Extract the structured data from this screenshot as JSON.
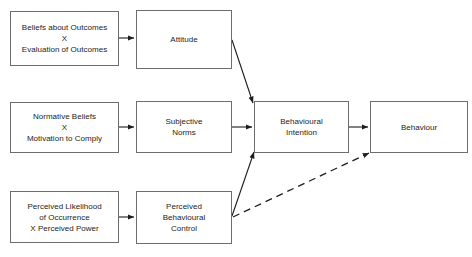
{
  "diagram": {
    "style": {
      "background": "#ffffff",
      "box_border_color": "#6d6d6d",
      "box_fill": "#ffffff",
      "text_color": "#1d1d1d",
      "connector_color": "#1d1d1d"
    },
    "nodes": [
      {
        "id": "beliefs-about-outcomes",
        "lines": [
          "Beliefs about Outcomes",
          "X",
          "Evaluation of Outcomes"
        ],
        "x": 10,
        "y": 11,
        "w": 109,
        "h": 55
      },
      {
        "id": "attitude",
        "lines": [
          "Attitude"
        ],
        "x": 136,
        "y": 10,
        "w": 96,
        "h": 59
      },
      {
        "id": "normative-beliefs",
        "lines": [
          "Normative Beliefs",
          "X",
          "Motivation to Comply"
        ],
        "x": 10,
        "y": 102,
        "w": 109,
        "h": 51
      },
      {
        "id": "subjective-norms",
        "lines": [
          "Subjective",
          "Norms"
        ],
        "x": 136,
        "y": 101,
        "w": 96,
        "h": 52
      },
      {
        "id": "behavioural-intention",
        "lines": [
          "Behavioural",
          "Intention"
        ],
        "x": 254,
        "y": 101,
        "w": 95,
        "h": 52
      },
      {
        "id": "behaviour",
        "lines": [
          "Behaviour"
        ],
        "x": 370,
        "y": 101,
        "w": 98,
        "h": 52
      },
      {
        "id": "perceived-likelihood",
        "lines": [
          "Perceived Likelihood",
          "of Occurrence",
          "X Perceived Power"
        ],
        "x": 10,
        "y": 191,
        "w": 109,
        "h": 52
      },
      {
        "id": "perceived-behavioural-control",
        "lines": [
          "Perceived",
          "Behavioural",
          "Control"
        ],
        "x": 136,
        "y": 191,
        "w": 96,
        "h": 53
      }
    ],
    "connectors": [
      {
        "id": "beliefs-to-attitude",
        "from": "beliefs-about-outcomes",
        "to": "attitude",
        "style": "solid",
        "x1": 119,
        "y1": 38,
        "x2": 134,
        "y2": 38
      },
      {
        "id": "attitude-to-intention",
        "from": "attitude",
        "to": "behavioural-intention",
        "style": "solid",
        "x1": 232,
        "y1": 40,
        "x2": 253,
        "y2": 103
      },
      {
        "id": "normative-to-norms",
        "from": "normative-beliefs",
        "to": "subjective-norms",
        "style": "solid",
        "x1": 119,
        "y1": 127,
        "x2": 134,
        "y2": 127
      },
      {
        "id": "norms-to-intention",
        "from": "subjective-norms",
        "to": "behavioural-intention",
        "style": "solid",
        "x1": 232,
        "y1": 127,
        "x2": 252,
        "y2": 127
      },
      {
        "id": "intention-to-behaviour",
        "from": "behavioural-intention",
        "to": "behaviour",
        "style": "solid",
        "x1": 349,
        "y1": 127,
        "x2": 368,
        "y2": 127
      },
      {
        "id": "likelihood-to-control",
        "from": "perceived-likelihood",
        "to": "perceived-behavioural-control",
        "style": "solid",
        "x1": 119,
        "y1": 217,
        "x2": 134,
        "y2": 217
      },
      {
        "id": "control-to-intention",
        "from": "perceived-behavioural-control",
        "to": "behavioural-intention",
        "style": "solid",
        "x1": 232,
        "y1": 216,
        "x2": 254,
        "y2": 152
      },
      {
        "id": "control-to-behaviour-dashed",
        "from": "perceived-behavioural-control",
        "to": "behaviour",
        "style": "dashed",
        "x1": 233,
        "y1": 217,
        "x2": 369,
        "y2": 153
      }
    ]
  }
}
